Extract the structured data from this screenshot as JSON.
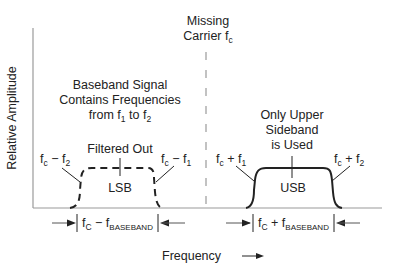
{
  "diagram": {
    "type": "frequency-spectrum",
    "y_axis_label": "Relative Amplitude",
    "x_axis_label": "Frequency",
    "carrier": {
      "line1": "Missing",
      "line2_prefix": "Carrier f",
      "line2_sub": "c"
    },
    "baseband_note": {
      "line1": "Baseband Signal",
      "line2": "Contains Frequencies",
      "line3_a": "from f",
      "line3_sub1": "1",
      "line3_b": " to f",
      "line3_sub2": "2"
    },
    "lsb": {
      "title": "Filtered Out",
      "label": "LSB",
      "left_edge": {
        "a": "f",
        "sub": "c",
        "b": " − f",
        "sub2": "2"
      },
      "right_edge": {
        "a": "f",
        "sub": "c",
        "b": " − f",
        "sub2": "1"
      },
      "dimension": {
        "a": "f",
        "sub": "C",
        "b": " − f",
        "sub2": "BASEBAND"
      },
      "style": "dashed"
    },
    "usb": {
      "title_line1": "Only Upper",
      "title_line2": "Sideband",
      "title_line3": "is Used",
      "label": "USB",
      "left_edge": {
        "a": "f",
        "sub": "c",
        "b": " + f",
        "sub2": "1"
      },
      "right_edge": {
        "a": "f",
        "sub": "c",
        "b": " + f",
        "sub2": "2"
      },
      "dimension": {
        "a": "f",
        "sub": "C",
        "b": " + f",
        "sub2": "BASEBAND"
      },
      "style": "solid"
    },
    "colors": {
      "axis": "#9a9a9a",
      "curve": "#222222",
      "text": "#222222"
    }
  }
}
